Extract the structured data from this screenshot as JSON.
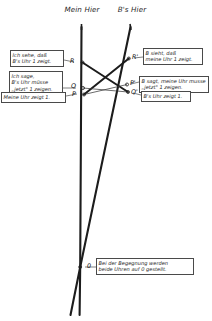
{
  "diagram": {
    "title_left": "Mein\nHier",
    "title_right": "B's\nHier",
    "worldlines": [
      {
        "name": "my-worldline",
        "label": "Mein Hier"
      },
      {
        "name": "b-worldline",
        "label": "B's Hier"
      }
    ],
    "points": [
      {
        "id": "R",
        "label": "R",
        "x": 82,
        "y": 62
      },
      {
        "id": "Rp",
        "label": "R'",
        "x": 129,
        "y": 58
      },
      {
        "id": "Q",
        "label": "Q",
        "x": 83,
        "y": 87
      },
      {
        "id": "P",
        "label": "P",
        "x": 84,
        "y": 94
      },
      {
        "id": "Pp",
        "label": "P'",
        "x": 127,
        "y": 84
      },
      {
        "id": "Qp",
        "label": "Q'",
        "x": 128,
        "y": 92
      },
      {
        "id": "O",
        "label": "0",
        "x": 80,
        "y": 267
      }
    ],
    "notes": [
      {
        "id": "note-ich-sehe",
        "text": "Ich sehe, daß\nB's Uhr 1 zeigt."
      },
      {
        "id": "note-ich-sage",
        "text": "Ich sage,\nB's Uhr müsse\n„jetzt\" 1 zeigen."
      },
      {
        "id": "note-meine-uhr",
        "text": "Meine Uhr zeigt 1."
      },
      {
        "id": "note-b-sieht",
        "text": "B sieht, daß\nmeine Uhr 1 zeigt."
      },
      {
        "id": "note-b-sagt",
        "text": "B sagt, meine Uhr musse\n„jetzt\" 1 zeigen."
      },
      {
        "id": "note-bs-uhr",
        "text": "B's Uhr zeigt 1."
      },
      {
        "id": "note-begegnung",
        "text": "Bei der Begegnung werden\nbeide Uhren auf 0 gestellt."
      }
    ],
    "colors": {
      "line": "#1c1c1c",
      "thin_line": "#3a3a3a",
      "box_border": "#4a4a4a",
      "background": "#ffffff"
    }
  }
}
